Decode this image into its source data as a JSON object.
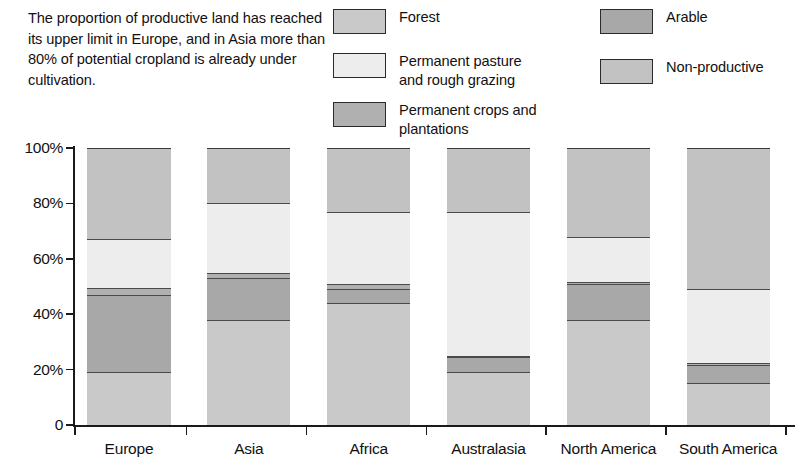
{
  "caption": {
    "text": "The proportion of productive land has reached its upper limit in Europe, and in Asia more than 80% of potential cropland is already under cultivation."
  },
  "legend": {
    "items": [
      {
        "label": "Forest",
        "color": "#c9c9c9",
        "column": "left",
        "key": "forest"
      },
      {
        "label": "Permanent pasture\nand rough grazing",
        "color": "#ededed",
        "column": "left",
        "key": "pasture"
      },
      {
        "label": "Permanent crops and\nplantations",
        "color": "#b0b0b0",
        "column": "left",
        "key": "crops"
      },
      {
        "label": "Arable",
        "color": "#a8a8a8",
        "column": "right",
        "key": "arable"
      },
      {
        "label": "Non-productive",
        "color": "#c2c2c2",
        "column": "right",
        "key": "nonproductive"
      }
    ]
  },
  "chart_data": {
    "type": "bar",
    "stacked": true,
    "stack_total": 100,
    "title": "",
    "xlabel": "",
    "ylabel": "",
    "ylim": [
      0,
      100
    ],
    "grid": false,
    "legend_position": "top-right",
    "categories": [
      "Europe",
      "Asia",
      "Africa",
      "Australasia",
      "North America",
      "South America"
    ],
    "ytick_labels": [
      "0",
      "20%",
      "40%",
      "60%",
      "80%",
      "100%"
    ],
    "ytick_values": [
      0,
      20,
      40,
      60,
      80,
      100
    ],
    "series": [
      {
        "name": "Forest",
        "color": "#c9c9c9",
        "values": [
          19,
          38,
          44,
          19,
          38,
          15
        ]
      },
      {
        "name": "Arable",
        "color": "#a8a8a8",
        "values": [
          28,
          15,
          5,
          5.5,
          13,
          6.5
        ]
      },
      {
        "name": "Permanent crops and plantations",
        "color": "#b0b0b0",
        "values": [
          2.5,
          2,
          2,
          0.5,
          0.5,
          1
        ]
      },
      {
        "name": "Permanent pasture and rough grazing",
        "color": "#ededed",
        "values": [
          17.5,
          25,
          26,
          52,
          16.5,
          26.5
        ]
      },
      {
        "name": "Non-productive",
        "color": "#c2c2c2",
        "values": [
          33,
          20,
          23,
          23,
          32,
          51
        ]
      }
    ]
  }
}
